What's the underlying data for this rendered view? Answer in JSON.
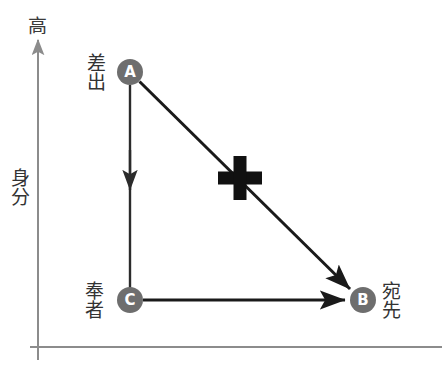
{
  "figure": {
    "background_color": "#ffffff",
    "width": 442,
    "height": 392
  },
  "axes": {
    "color": "#8c8c8c",
    "y_axis": {
      "label": "身分",
      "top_cap_label": "高",
      "arrow_direction": "up"
    },
    "x_axis": {
      "label": ""
    }
  },
  "nodes": [
    {
      "id": "A",
      "letter": "A",
      "label": "差出",
      "label_position": "left",
      "cx": 130,
      "cy": 72,
      "r": 13,
      "fill": "#6e6e6e"
    },
    {
      "id": "C",
      "letter": "C",
      "label": "奉者",
      "label_position": "left",
      "cx": 130,
      "cy": 300,
      "r": 13,
      "fill": "#6e6e6e"
    },
    {
      "id": "B",
      "letter": "B",
      "label": "宛先",
      "label_position": "right",
      "cx": 363,
      "cy": 300,
      "r": 13,
      "fill": "#6e6e6e"
    }
  ],
  "edges": [
    {
      "id": "a-to-c",
      "from": "A",
      "to": "C",
      "style": "solid",
      "color": "#2b2b2b",
      "arrowhead": "mid"
    },
    {
      "id": "a-to-b",
      "from": "A",
      "to": "B",
      "style": "solid",
      "color": "#1a1a1a",
      "arrowhead": "end"
    },
    {
      "id": "c-to-b",
      "from": "C",
      "to": "B",
      "style": "solid",
      "color": "#1a1a1a",
      "arrowhead": "end"
    }
  ],
  "annotations": [
    {
      "id": "cross-mark",
      "symbol": "plus",
      "color": "#111111",
      "cx": 240,
      "cy": 178,
      "size": 44,
      "thickness": 13
    }
  ]
}
